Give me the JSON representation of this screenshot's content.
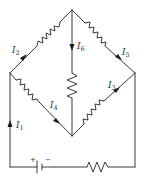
{
  "diagram": {
    "type": "circuit",
    "colors": {
      "line": "#3a3a3a",
      "arrow": "#1a1a1a",
      "text": "#333333",
      "background": "#ffffff"
    },
    "currents": [
      {
        "id": "I1",
        "symbol": "I",
        "sub": "1",
        "direction": "up"
      },
      {
        "id": "I2",
        "symbol": "I",
        "sub": "2",
        "direction": "up-right"
      },
      {
        "id": "I3",
        "symbol": "I",
        "sub": "3",
        "direction": "up-right"
      },
      {
        "id": "I4",
        "symbol": "I",
        "sub": "4",
        "direction": "down-right"
      },
      {
        "id": "I5",
        "symbol": "I",
        "sub": "5",
        "direction": "down-right"
      },
      {
        "id": "I6",
        "symbol": "I",
        "sub": "6",
        "direction": "down"
      }
    ],
    "battery": {
      "plus": "+",
      "minus": "−"
    },
    "resistor_count": 6
  }
}
